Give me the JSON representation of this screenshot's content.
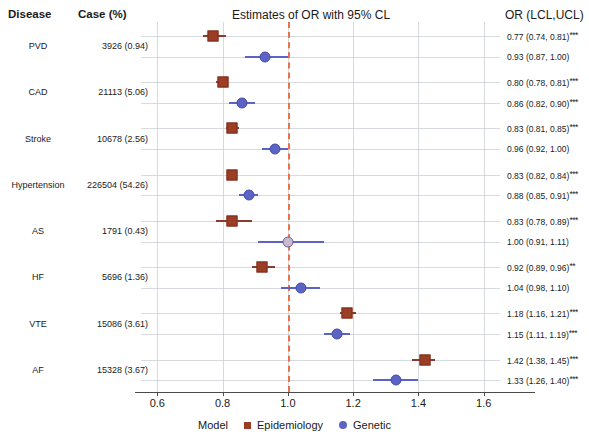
{
  "header": {
    "disease_col": "Disease",
    "case_col": "Case (%)",
    "title": "Estimates of OR with 95% CL",
    "or_col": "OR (LCL,UCL)"
  },
  "axis": {
    "ticks": [
      "0.6",
      "0.8",
      "1.0",
      "1.2",
      "1.4",
      "1.6"
    ],
    "tick_values": [
      0.6,
      0.8,
      1.0,
      1.2,
      1.4,
      1.6
    ],
    "xmin": 0.55,
    "xmax": 1.65,
    "reference_line": 1.0,
    "reference_color": "#e8734a"
  },
  "legend": {
    "label": "Model",
    "entries": [
      {
        "name": "Epidemiology",
        "color": "#9c3d25",
        "shape": "square"
      },
      {
        "name": "Genetic",
        "color": "#5b63c4",
        "shape": "circle"
      }
    ]
  },
  "chart_data": {
    "type": "scatter",
    "title": "Estimates of OR with 95% CL",
    "xlabel": "",
    "ylabel": "Disease",
    "xlim": [
      0.55,
      1.65
    ],
    "grid": true,
    "legend_position": "bottom",
    "reference_line": 1.0,
    "categories": [
      "PVD",
      "CAD",
      "Stroke",
      "Hypertension",
      "AS",
      "HF",
      "VTE",
      "AF"
    ],
    "cases": [
      "3926 (0.94)",
      "21113 (5.06)",
      "10678 (2.56)",
      "226504 (54.26)",
      "1791 (0.43)",
      "5696 (1.36)",
      "15086 (3.61)",
      "15328 (3.67)"
    ],
    "series": [
      {
        "name": "Epidemiology",
        "color": "#9c3d25",
        "shape": "square",
        "points": [
          {
            "disease": "PVD",
            "or": 0.77,
            "lcl": 0.74,
            "ucl": 0.81,
            "sig": "***",
            "text": "0.77 (0.74, 0.81)"
          },
          {
            "disease": "CAD",
            "or": 0.8,
            "lcl": 0.78,
            "ucl": 0.81,
            "sig": "***",
            "text": "0.80 (0.78, 0.81)"
          },
          {
            "disease": "Stroke",
            "or": 0.83,
            "lcl": 0.81,
            "ucl": 0.85,
            "sig": "***",
            "text": "0.83 (0.81, 0.85)"
          },
          {
            "disease": "Hypertension",
            "or": 0.83,
            "lcl": 0.82,
            "ucl": 0.84,
            "sig": "***",
            "text": "0.83 (0.82, 0.84)"
          },
          {
            "disease": "AS",
            "or": 0.83,
            "lcl": 0.78,
            "ucl": 0.89,
            "sig": "***",
            "text": "0.83 (0.78, 0.89)"
          },
          {
            "disease": "HF",
            "or": 0.92,
            "lcl": 0.89,
            "ucl": 0.96,
            "sig": "**",
            "text": "0.92 (0.89, 0.96)"
          },
          {
            "disease": "VTE",
            "or": 1.18,
            "lcl": 1.16,
            "ucl": 1.21,
            "sig": "***",
            "text": "1.18 (1.16, 1.21)"
          },
          {
            "disease": "AF",
            "or": 1.42,
            "lcl": 1.38,
            "ucl": 1.45,
            "sig": "***",
            "text": "1.42 (1.38, 1.45)"
          }
        ]
      },
      {
        "name": "Genetic",
        "color": "#5b63c4",
        "shape": "circle",
        "points": [
          {
            "disease": "PVD",
            "or": 0.93,
            "lcl": 0.87,
            "ucl": 1.0,
            "sig": "",
            "text": "0.93 (0.87, 1.00)"
          },
          {
            "disease": "CAD",
            "or": 0.86,
            "lcl": 0.82,
            "ucl": 0.9,
            "sig": "***",
            "text": "0.86 (0.82, 0.90)"
          },
          {
            "disease": "Stroke",
            "or": 0.96,
            "lcl": 0.92,
            "ucl": 1.0,
            "sig": "",
            "text": "0.96 (0.92, 1.00)"
          },
          {
            "disease": "Hypertension",
            "or": 0.88,
            "lcl": 0.85,
            "ucl": 0.91,
            "sig": "***",
            "text": "0.88 (0.85, 0.91)"
          },
          {
            "disease": "AS",
            "or": 1.0,
            "lcl": 0.91,
            "ucl": 1.11,
            "sig": "",
            "text": "1.00 (0.91, 1.11)"
          },
          {
            "disease": "HF",
            "or": 1.04,
            "lcl": 0.98,
            "ucl": 1.1,
            "sig": "",
            "text": "1.04 (0.98, 1.10)"
          },
          {
            "disease": "VTE",
            "or": 1.15,
            "lcl": 1.11,
            "ucl": 1.19,
            "sig": "***",
            "text": "1.15 (1.11, 1.19)"
          },
          {
            "disease": "AF",
            "or": 1.33,
            "lcl": 1.26,
            "ucl": 1.4,
            "sig": "***",
            "text": "1.33 (1.26, 1.40)"
          }
        ]
      }
    ]
  }
}
